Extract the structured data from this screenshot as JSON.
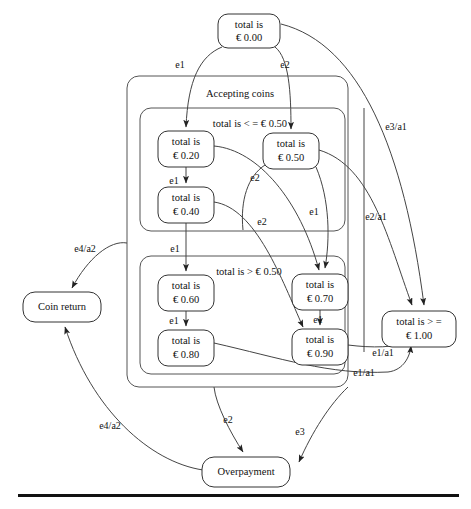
{
  "diagram": {
    "nodes": [
      {
        "id": "n000",
        "line1": "total is",
        "line2": "€ 0.00",
        "x": 218,
        "y": 14,
        "w": 62,
        "h": 34
      },
      {
        "id": "n020",
        "line1": "total is",
        "line2": "€ 0.20",
        "x": 158,
        "y": 131,
        "w": 56,
        "h": 36
      },
      {
        "id": "n040",
        "line1": "total is",
        "line2": "€ 0.40",
        "x": 158,
        "y": 187,
        "w": 56,
        "h": 36
      },
      {
        "id": "n050",
        "line1": "total is",
        "line2": "€ 0.50",
        "x": 263,
        "y": 133,
        "w": 56,
        "h": 36
      },
      {
        "id": "n060",
        "line1": "total is",
        "line2": "€ 0.60",
        "x": 158,
        "y": 275,
        "w": 56,
        "h": 36
      },
      {
        "id": "n080",
        "line1": "total is",
        "line2": "€ 0.80",
        "x": 158,
        "y": 330,
        "w": 56,
        "h": 36
      },
      {
        "id": "n070",
        "line1": "total is",
        "line2": "€ 0.70",
        "x": 292,
        "y": 274,
        "w": 56,
        "h": 36
      },
      {
        "id": "n090",
        "line1": "total is",
        "line2": "€ 0.90",
        "x": 292,
        "y": 329,
        "w": 56,
        "h": 36
      },
      {
        "id": "n100",
        "line1": "total is > =",
        "line2": "€ 1.00",
        "x": 382,
        "y": 311,
        "w": 74,
        "h": 36
      },
      {
        "id": "coinret",
        "line1": "Coin return",
        "line2": "",
        "x": 23,
        "y": 292,
        "w": 78,
        "h": 30
      },
      {
        "id": "overpay",
        "line1": "Overpayment",
        "line2": "",
        "x": 202,
        "y": 457,
        "w": 88,
        "h": 30
      }
    ],
    "groups": [
      {
        "id": "accepting",
        "label": "Accepting coins",
        "x": 127,
        "y": 76,
        "w": 221,
        "h": 311,
        "label_x": 240,
        "label_y": 93
      },
      {
        "id": "lessthan",
        "label": "total is < = € 0.50",
        "x": 140,
        "y": 108,
        "w": 205,
        "h": 123,
        "label_x": 250,
        "label_y": 123
      },
      {
        "id": "greater",
        "label": "total is > € 0.50",
        "x": 140,
        "y": 256,
        "w": 205,
        "h": 118,
        "label_x": 249,
        "label_y": 271
      }
    ],
    "edge_labels": [
      {
        "id": "e1-top",
        "text": "e1",
        "x": 180,
        "y": 65
      },
      {
        "id": "e2-top",
        "text": "e2",
        "x": 285,
        "y": 65
      },
      {
        "id": "e1-020-040",
        "text": "e1",
        "x": 186,
        "y": 181
      },
      {
        "id": "e2-050-out",
        "text": "e2",
        "x": 255,
        "y": 178
      },
      {
        "id": "e1-050-out",
        "text": "e1",
        "x": 314,
        "y": 212
      },
      {
        "id": "e2-040-out",
        "text": "e2",
        "x": 262,
        "y": 222
      },
      {
        "id": "e1-040-060",
        "text": "e1",
        "x": 180,
        "y": 249
      },
      {
        "id": "e1-060-080",
        "text": "e1",
        "x": 186,
        "y": 321
      },
      {
        "id": "e1-070-090",
        "text": "e1",
        "x": 318,
        "y": 320
      },
      {
        "id": "e3a1",
        "text": "e3/a1",
        "x": 396,
        "y": 127
      },
      {
        "id": "e2a1",
        "text": "e2/a1",
        "x": 376,
        "y": 217
      },
      {
        "id": "e1a1-upper",
        "text": "e1/a1",
        "x": 383,
        "y": 353
      },
      {
        "id": "e1a1-lower",
        "text": "e1/a1",
        "x": 364,
        "y": 373
      },
      {
        "id": "e4a2-upper",
        "text": "e4/a2",
        "x": 85,
        "y": 249
      },
      {
        "id": "e4a2-lower",
        "text": "e4/a2",
        "x": 110,
        "y": 426
      },
      {
        "id": "e2-overpay",
        "text": "e2",
        "x": 228,
        "y": 420
      },
      {
        "id": "e3-overpay",
        "text": "e3",
        "x": 300,
        "y": 432
      }
    ],
    "rule": {
      "x": 18,
      "y": 494,
      "w": 441,
      "h": 3
    }
  }
}
